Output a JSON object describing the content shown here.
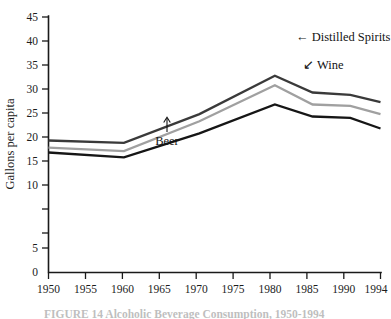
{
  "chart_data": {
    "type": "line",
    "title": "",
    "xlabel": "",
    "ylabel": "Gallons per capita",
    "x": [
      1950,
      1960,
      1970,
      1980,
      1985,
      1990,
      1994
    ],
    "xlim": [
      1950,
      1994
    ],
    "ylim": [
      0,
      45
    ],
    "grid": false,
    "legend_position": "inline-annotations",
    "xticks": [
      "1950",
      "1955",
      "1960",
      "1965",
      "1970",
      "1975",
      "1980",
      "1985",
      "1990",
      "1994"
    ],
    "xtick_values": [
      1950,
      1955,
      1960,
      1965,
      1970,
      1975,
      1980,
      1985,
      1990,
      1994
    ],
    "yticks": [
      "0",
      "5",
      "10",
      "15",
      "20",
      "25",
      "30",
      "35",
      "40",
      "45"
    ],
    "ytick_values": [
      0,
      5,
      10,
      15,
      20,
      25,
      30,
      35,
      40,
      45
    ],
    "series": [
      {
        "name": "Distilled Spirits",
        "color": "#3a3a3a",
        "values": [
          27.5,
          27.0,
          33.0,
          41.0,
          37.5,
          37.0,
          35.5
        ]
      },
      {
        "name": "Wine",
        "color": "#a0a0a0",
        "values": [
          26.0,
          25.3,
          31.5,
          39.0,
          35.0,
          34.7,
          33.0
        ]
      },
      {
        "name": "Beer",
        "color": "#161616",
        "values": [
          25.0,
          24.0,
          29.0,
          35.0,
          32.5,
          32.2,
          30.0
        ]
      }
    ],
    "annotations": [
      {
        "name": "distilled-spirits",
        "text": "Distilled Spirits",
        "marker": "←",
        "marker_text": "← Distilled Spirits"
      },
      {
        "name": "wine",
        "text": "Wine",
        "marker": "↙",
        "marker_text": "↙ Wine"
      },
      {
        "name": "beer",
        "text": "Beer",
        "marker": "↑",
        "marker_text": "Beer"
      }
    ]
  },
  "axes": {
    "y_axis_title": "Gallons per capita"
  },
  "caption": {
    "text": "FIGURE 14 Alcoholic Beverage Consumption, 1950-1994"
  },
  "colors": {
    "distilled_spirits": "#3a3a3a",
    "wine": "#a0a0a0",
    "beer": "#161616",
    "axis": "#1a1a1a",
    "background": "#ffffff"
  }
}
